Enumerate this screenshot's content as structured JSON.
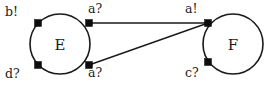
{
  "diagram": {
    "type": "state-transition-graph",
    "canvas": {
      "width": 277,
      "height": 87,
      "background": "#ffffff"
    },
    "stroke_color": "#1a1a1a",
    "port_color": "#0d0d0d",
    "nodes": [
      {
        "id": "E",
        "label": "E",
        "cx": 60,
        "cy": 44,
        "r": 30
      },
      {
        "id": "F",
        "label": "F",
        "cx": 233,
        "cy": 44,
        "r": 30
      }
    ],
    "ports": [
      {
        "id": "E-top-left",
        "label": "b!",
        "cx": 38,
        "cy": 23,
        "size": 7,
        "label_x": 5,
        "label_y": 6
      },
      {
        "id": "E-top-right",
        "label": "a?",
        "cx": 89,
        "cy": 23,
        "size": 7,
        "label_x": 88,
        "label_y": 3
      },
      {
        "id": "E-bottom-left",
        "label": "d?",
        "cx": 38,
        "cy": 65,
        "size": 7,
        "label_x": 5,
        "label_y": 68
      },
      {
        "id": "E-bottom-right",
        "label": "a?",
        "cx": 89,
        "cy": 65,
        "size": 7,
        "label_x": 88,
        "label_y": 67
      },
      {
        "id": "F-top-left",
        "label": "a!",
        "cx": 208,
        "cy": 23,
        "size": 7,
        "label_x": 185,
        "label_y": 3
      },
      {
        "id": "F-bottom-left",
        "label": "c?",
        "cx": 208,
        "cy": 62,
        "size": 7,
        "label_x": 185,
        "label_y": 67
      }
    ],
    "edges": [
      {
        "id": "edge-top",
        "from": "E-top-right",
        "to": "F-top-left",
        "x1": 89,
        "y1": 23,
        "x2": 208,
        "y2": 23
      },
      {
        "id": "edge-diagonal",
        "from": "E-bottom-right",
        "to": "F-top-left",
        "x1": 89,
        "y1": 65,
        "x2": 208,
        "y2": 23
      }
    ]
  }
}
